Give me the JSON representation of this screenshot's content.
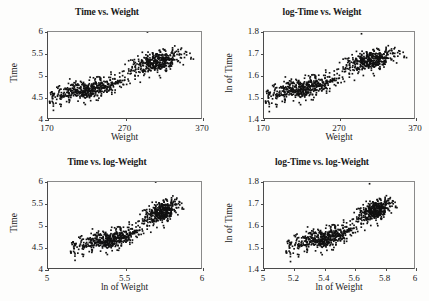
{
  "figure": {
    "background_color": "#fdfdfc",
    "point_color": "#111111",
    "axis_color": "#4a4a4a",
    "panel_count": 4
  },
  "chart_data": [
    {
      "type": "scatter",
      "panel": "top-left",
      "title": "Time vs. Weight",
      "xlabel": "Weight",
      "ylabel": "Time",
      "xlim": [
        170,
        370
      ],
      "ylim": [
        4,
        6
      ],
      "xticks": [
        170,
        270,
        370
      ],
      "xticklabels": [
        "170",
        "270",
        "370"
      ],
      "yticks": [
        4,
        4.5,
        5,
        5.5,
        6
      ],
      "yticklabels": [
        "4",
        "4.5",
        "5",
        "5.5",
        "6"
      ],
      "grid": false,
      "legend": "none",
      "n_points": 900,
      "annotation": "Dense positively-correlated cloud; lower lobe near Weight 180-260 at Time 4.2-4.9, denser upper lobe near Weight 290-345 at Time 5.0-5.7; one outlier at top border near Weight 300, Time 6.0"
    },
    {
      "type": "scatter",
      "panel": "top-right",
      "title": "log-Time vs. Weight",
      "xlabel": "Weight",
      "ylabel": "ln of Time",
      "xlim": [
        170,
        370
      ],
      "ylim": [
        1.4,
        1.8
      ],
      "xticks": [
        170,
        270,
        370
      ],
      "xticklabels": [
        "170",
        "270",
        "370"
      ],
      "yticks": [
        1.4,
        1.5,
        1.6,
        1.7,
        1.8
      ],
      "yticklabels": [
        "1.4",
        "1.5",
        "1.6",
        "1.7",
        "1.8"
      ],
      "grid": false,
      "legend": "none",
      "n_points": 900,
      "annotation": "Same data with natural-log transformed Time; positively correlated band rising from (180, 1.48) to (345, 1.72); one outlier at top border near Weight 300, ln of Time 1.79"
    },
    {
      "type": "scatter",
      "panel": "bottom-left",
      "title": "Time vs. log-Weight",
      "xlabel": "ln of Weight",
      "ylabel": "Time",
      "xlim": [
        5,
        6
      ],
      "ylim": [
        4,
        6
      ],
      "xticks": [
        5,
        5.5,
        6
      ],
      "xticklabels": [
        "5",
        "5.5",
        "6"
      ],
      "yticks": [
        4,
        4.5,
        5,
        5.5,
        6
      ],
      "yticklabels": [
        "4",
        "4.5",
        "5",
        "5.5",
        "6"
      ],
      "grid": false,
      "legend": "none",
      "n_points": 900,
      "annotation": "Natural-log transformed Weight on x; cloud rises from (5.15, 4.4) to (5.85, 5.5); one outlier at top border near ln of Weight 5.70, Time 6.0"
    },
    {
      "type": "scatter",
      "panel": "bottom-right",
      "title": "log-Time vs. log-Weight",
      "xlabel": "ln of Weight",
      "ylabel": "ln of Time",
      "xlim": [
        5,
        6
      ],
      "ylim": [
        1.4,
        1.8
      ],
      "xticks": [
        5,
        5.2,
        5.4,
        5.6,
        5.8,
        6
      ],
      "xticklabels": [
        "5",
        "5.2",
        "5.4",
        "5.6",
        "5.8",
        "6"
      ],
      "yticks": [
        1.4,
        1.5,
        1.6,
        1.7,
        1.8
      ],
      "yticklabels": [
        "1.4",
        "1.5",
        "1.6",
        "1.7",
        "1.8"
      ],
      "grid": false,
      "legend": "none",
      "n_points": 900,
      "annotation": "Both variables log transformed; most linear of the four panels, band rising from (5.12, 1.48) to (5.86, 1.71); one outlier at top border near ln of Weight 5.70, ln of Time 1.79"
    }
  ]
}
